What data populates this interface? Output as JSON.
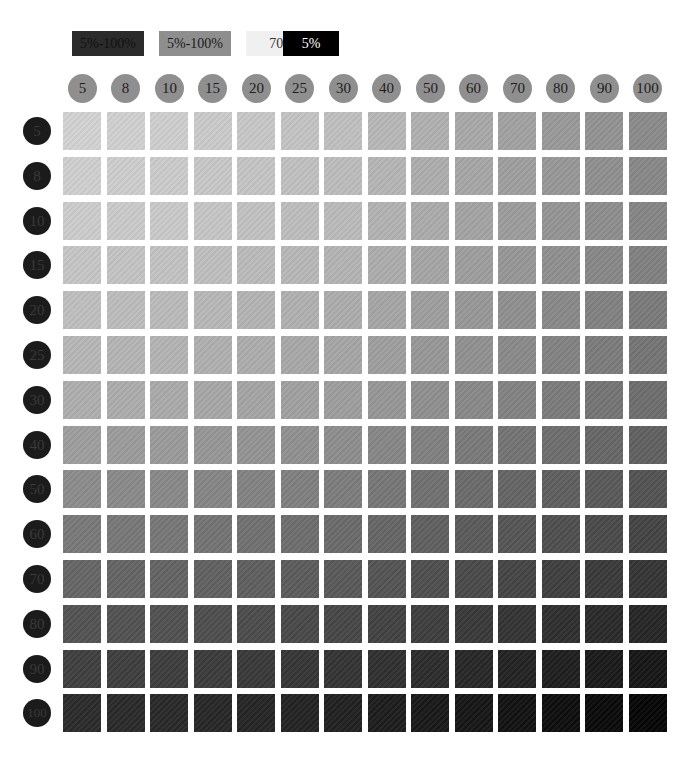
{
  "legend": [
    {
      "label": "5%-100%",
      "bg": "#2b2b2b",
      "fg": "#111111",
      "left": 72,
      "width": 72
    },
    {
      "label": "5%-100%",
      "bg": "#8e8e8e",
      "fg": "#1a1a1a",
      "left": 159,
      "width": 72
    },
    {
      "label": "70%",
      "bg": "#f0f0f0",
      "fg": "#333333",
      "left": 246,
      "width": 72
    },
    {
      "label": "5%",
      "bg": "#000000",
      "fg": "#ffffff",
      "left": 283,
      "width": 56
    }
  ],
  "chart_data": {
    "type": "heatmap",
    "title": "",
    "legend": [
      "5%-100%",
      "5%-100%",
      "70%",
      "5%"
    ],
    "x": [
      5,
      8,
      10,
      15,
      20,
      25,
      30,
      40,
      50,
      60,
      70,
      80,
      90,
      100
    ],
    "y": [
      5,
      8,
      10,
      15,
      20,
      25,
      30,
      40,
      50,
      60,
      70,
      80,
      90,
      100
    ],
    "xlabel": "column tint %",
    "ylabel": "row tint %",
    "value_description": "gray level of each swatch (0=black, 255=white), estimated",
    "corner_values": {
      "top_left": 210,
      "top_right": 138,
      "bottom_left": 42,
      "bottom_right": 5
    }
  },
  "layout": {
    "col_x0": 63,
    "col_pitch": 43.5,
    "row_y0": 112,
    "row_pitch": 44.8
  }
}
